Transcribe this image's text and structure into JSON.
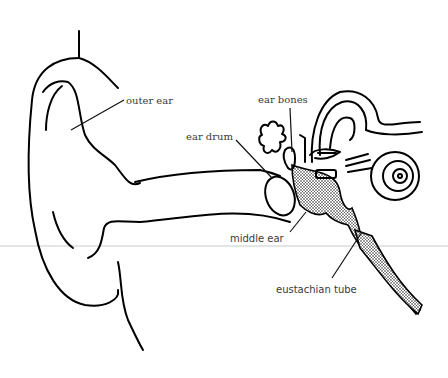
{
  "diagram": {
    "labels": {
      "outer_ear": "outer ear",
      "ear_bones": "ear bones",
      "ear_drum": "ear drum",
      "middle_ear": "middle ear",
      "eustachian_tube": "eustachian tube"
    },
    "colors": {
      "line": "#000000",
      "label_text": "#3a3a3a",
      "background": "#ffffff",
      "stipple": "#222222"
    }
  }
}
